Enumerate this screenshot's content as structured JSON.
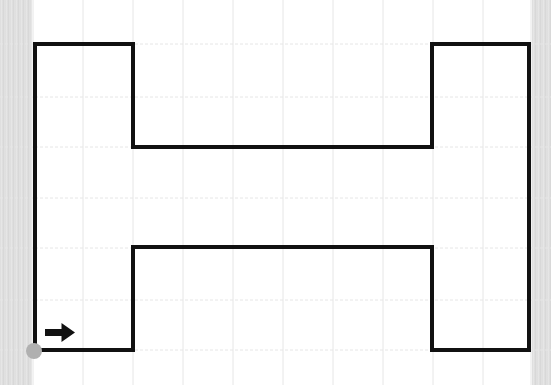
{
  "canvas": {
    "width": 551,
    "height": 385,
    "background": "#ffffff"
  },
  "colors": {
    "path": "#111111",
    "grid": "#e6e6e6",
    "start_dot": "#b0b0b0",
    "arrow": "#111111",
    "edge_strip": "#dddddd"
  },
  "grid": {
    "pitch": 50,
    "x_lines": [
      33,
      83,
      133,
      183,
      233,
      283,
      333,
      383,
      433,
      483,
      531
    ],
    "y_lines": [
      44,
      97,
      147,
      198,
      248,
      300,
      350
    ]
  },
  "path": {
    "stroke_width": 4,
    "points": [
      [
        35,
        350
      ],
      [
        35,
        44
      ],
      [
        133,
        44
      ],
      [
        133,
        147
      ],
      [
        432,
        147
      ],
      [
        432,
        44
      ],
      [
        529,
        44
      ],
      [
        529,
        350
      ],
      [
        432,
        350
      ],
      [
        432,
        247
      ],
      [
        133,
        247
      ],
      [
        133,
        350
      ],
      [
        35,
        350
      ]
    ]
  },
  "start_marker": {
    "cx": 34,
    "cy": 351,
    "r": 8
  },
  "direction_arrow": {
    "direction": "right",
    "x": 45,
    "y": 323,
    "width": 30,
    "height": 19,
    "icon": "arrow-right-icon"
  }
}
